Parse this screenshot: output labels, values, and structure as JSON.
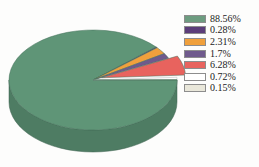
{
  "background_color": "#fdfdfc",
  "chart_data": {
    "type": "pie",
    "title": "",
    "subtitle": "",
    "xlabel": "",
    "ylabel": "",
    "grid": false,
    "legend_position": "right",
    "three_d": true,
    "exploded_slices": [
      "6.28%"
    ],
    "start_angle_deg": 0,
    "direction": "clockwise",
    "labels": [
      "88.56%",
      "0.28%",
      "2.31%",
      "1.7%",
      "6.28%",
      "0.72%",
      "0.15%"
    ],
    "values": [
      88.56,
      0.28,
      2.31,
      1.7,
      6.28,
      0.72,
      0.15
    ],
    "colors": [
      "#5f9577",
      "#5b3d7a",
      "#f0a03c",
      "#6f5a8c",
      "#e8635e",
      "#ffffff",
      "#e9e7da"
    ],
    "side_colors": [
      "#4e7c63",
      "#452d5e",
      "#c8822c",
      "#5a4873",
      "#c14f4c",
      "#dedede",
      "#c9c7ba"
    ],
    "slices": [
      {
        "label": "88.56%",
        "value": 88.56,
        "color": "#5f9577",
        "exploded": false
      },
      {
        "label": "0.28%",
        "value": 0.28,
        "color": "#5b3d7a",
        "exploded": false
      },
      {
        "label": "2.31%",
        "value": 2.31,
        "color": "#f0a03c",
        "exploded": false
      },
      {
        "label": "1.7%",
        "value": 1.7,
        "color": "#6f5a8c",
        "exploded": false
      },
      {
        "label": "6.28%",
        "value": 6.28,
        "color": "#e8635e",
        "exploded": true
      },
      {
        "label": "0.72%",
        "value": 0.72,
        "color": "#ffffff",
        "exploded": false
      },
      {
        "label": "0.15%",
        "value": 0.15,
        "color": "#e9e7da",
        "exploded": false
      }
    ]
  },
  "legend": {
    "items": [
      {
        "label": "88.56%",
        "color": "#6d9c80"
      },
      {
        "label": "0.28%",
        "color": "#5b3d7a"
      },
      {
        "label": "2.31%",
        "color": "#f0a03c"
      },
      {
        "label": "1.7%",
        "color": "#6f5a8c"
      },
      {
        "label": "6.28%",
        "color": "#e8635e"
      },
      {
        "label": "0.72%",
        "color": "#ffffff"
      },
      {
        "label": "0.15%",
        "color": "#e9e7da"
      }
    ]
  }
}
